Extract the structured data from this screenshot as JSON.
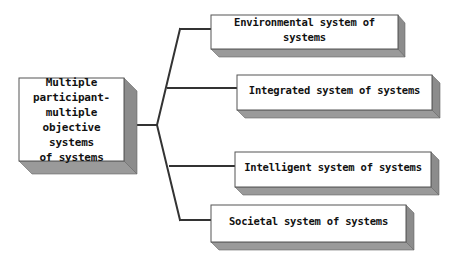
{
  "diagram": {
    "colors": {
      "face": "#ffffff",
      "side": "#8c8c8c",
      "bottom": "#9a9a9a",
      "edge": "#555555",
      "connector": "#333333"
    },
    "root": {
      "label": "Multiple\nparticipant-\nmultiple\nobjective systems\nof systems"
    },
    "branches": [
      {
        "label": "Environmental system of systems"
      },
      {
        "label": "Integrated system of systems"
      },
      {
        "label": "Intelligent system of systems"
      },
      {
        "label": "Societal system of systems"
      }
    ]
  }
}
